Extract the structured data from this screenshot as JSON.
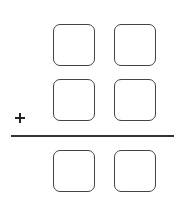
{
  "problem": {
    "type": "vertical-addition",
    "operator": "+",
    "rows": [
      {
        "name": "addend-1",
        "digits": [
          "",
          ""
        ]
      },
      {
        "name": "addend-2",
        "digits": [
          "",
          ""
        ]
      },
      {
        "name": "sum",
        "digits": [
          "",
          ""
        ]
      }
    ]
  }
}
